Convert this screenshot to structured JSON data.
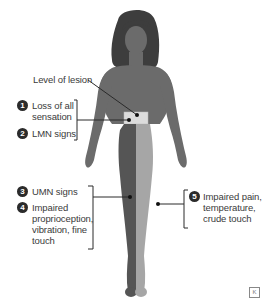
{
  "diagram": {
    "type": "anatomical-figure",
    "colors": {
      "body": "#6b6b6b",
      "hair": "#3d3d3d",
      "lesion_band": "#dcdcdc",
      "ipsilateral_leg": "#555555",
      "contralateral_leg": "#a6a6a6",
      "lines": "#2a2a2a"
    },
    "lesion_label": "Level of lesion",
    "callouts": [
      {
        "number": "1",
        "text_lines": [
          "Loss of all",
          "sensation"
        ]
      },
      {
        "number": "2",
        "text_lines": [
          "LMN signs"
        ]
      },
      {
        "number": "3",
        "text_lines": [
          "UMN signs"
        ]
      },
      {
        "number": "4",
        "text_lines": [
          "Impaired",
          "proprioception,",
          "vibration, fine",
          "touch"
        ]
      },
      {
        "number": "5",
        "text_lines": [
          "Impaired pain,",
          "temperature,",
          "crude touch"
        ]
      }
    ],
    "logo_glyph": "K"
  }
}
